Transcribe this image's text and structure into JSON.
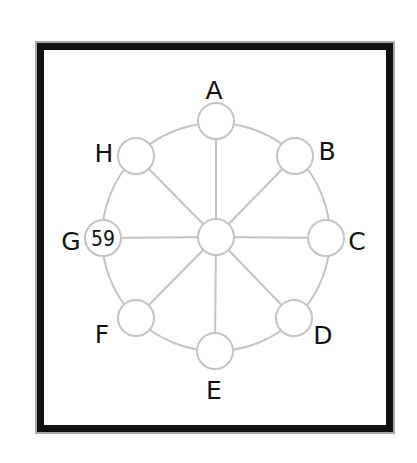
{
  "diagram": {
    "type": "wheel-puzzle",
    "colors": {
      "frame": "#111111",
      "frame_edge": "#a8a8a8",
      "lines": "#c4c4c4",
      "node_fill": "#ffffff",
      "text": "#111111"
    },
    "center": {
      "x": 216,
      "y": 237,
      "r": 18,
      "value": ""
    },
    "ring_radius": 114,
    "nodes": [
      {
        "id": "A",
        "label": "A",
        "x": 216,
        "y": 121,
        "label_x": 214,
        "label_y": 99,
        "value": ""
      },
      {
        "id": "B",
        "label": "B",
        "x": 295,
        "y": 156,
        "label_x": 327,
        "label_y": 160,
        "value": ""
      },
      {
        "id": "C",
        "label": "C",
        "x": 326,
        "y": 238,
        "label_x": 357,
        "label_y": 250,
        "value": ""
      },
      {
        "id": "D",
        "label": "D",
        "x": 294,
        "y": 318,
        "label_x": 323,
        "label_y": 344,
        "value": ""
      },
      {
        "id": "E",
        "label": "E",
        "x": 215,
        "y": 351,
        "label_x": 214,
        "label_y": 399,
        "value": ""
      },
      {
        "id": "F",
        "label": "F",
        "x": 136,
        "y": 318,
        "label_x": 102,
        "label_y": 343,
        "value": ""
      },
      {
        "id": "G",
        "label": "G",
        "x": 103,
        "y": 238,
        "label_x": 71,
        "label_y": 250,
        "value": "59"
      },
      {
        "id": "H",
        "label": "H",
        "x": 136,
        "y": 156,
        "label_x": 104,
        "label_y": 162,
        "value": ""
      }
    ]
  }
}
